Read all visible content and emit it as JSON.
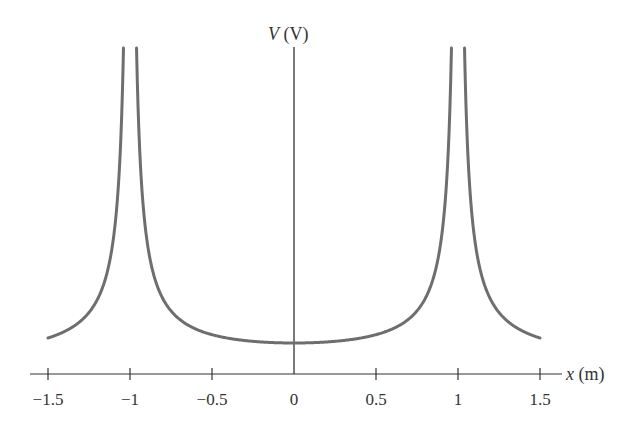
{
  "chart_data": {
    "type": "line",
    "title": "",
    "xlabel": "x (m)",
    "ylabel": "V (V)",
    "xlabel_var": "x",
    "xlabel_unit": " (m)",
    "ylabel_var": "V",
    "ylabel_unit": " (V)",
    "xlim": [
      -1.5,
      1.5
    ],
    "x_ticks": [
      -1.5,
      -1,
      -0.5,
      0,
      0.5,
      1,
      1.5
    ],
    "x_tick_labels": [
      "−1.5",
      "−1",
      "−0.5",
      "0",
      "0.5",
      "1",
      "1.5"
    ],
    "y_ticks": [],
    "grid": false,
    "legend": null,
    "series": [
      {
        "name": "V(x) = k(1/|x-1| + 1/|x+1|)",
        "color": "#6e6e6e",
        "description": "Potential with singularities at x = -1 and x = 1, minimum at x = 0",
        "x": [
          -1.5,
          -1.3,
          -1.2,
          -1.1,
          -1.05,
          -0.95,
          -0.9,
          -0.8,
          -0.6,
          -0.4,
          -0.2,
          0,
          0.2,
          0.4,
          0.6,
          0.8,
          0.9,
          0.95,
          1.05,
          1.1,
          1.2,
          1.3,
          1.5
        ],
        "y_relative": [
          2.4,
          3.7,
          5.45,
          10.48,
          20.49,
          20.51,
          10.53,
          5.56,
          3.13,
          2.38,
          2.08,
          2.0,
          2.08,
          2.38,
          3.13,
          5.56,
          10.53,
          20.51,
          20.49,
          10.48,
          5.45,
          3.7,
          2.4
        ]
      }
    ]
  }
}
